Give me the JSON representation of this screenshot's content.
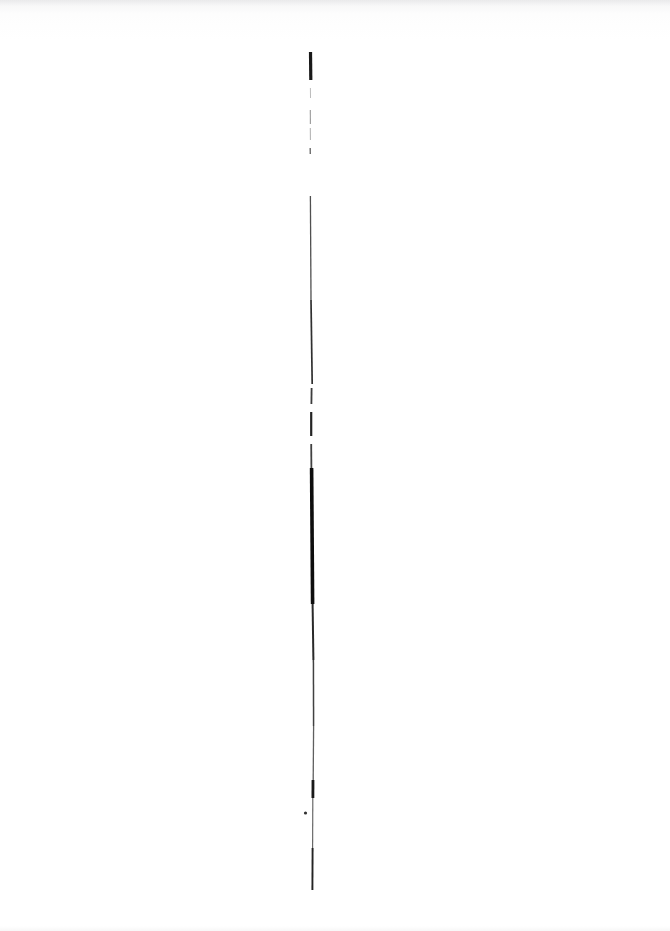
{
  "document": {
    "kind": "scanned-page",
    "page_width": 670,
    "page_height": 931,
    "background_color": "#ffffff",
    "ink_color": "#111111",
    "visible_text": "",
    "caption": ""
  },
  "artwork": {
    "name": "vertical-ink-stroke",
    "description": "A single near-vertical hand-drawn ink stroke running down the middle of an otherwise blank scanned page.",
    "stroke_color": "#0d0d0d",
    "start_y": 52,
    "end_y": 890,
    "center_x": 311,
    "segments": [
      {
        "name": "top-bold-tick",
        "y0": 52,
        "y1": 80,
        "x0": 310.5,
        "x1": 310.8,
        "width": 3.2,
        "opacity": 0.95
      },
      {
        "name": "faint-dash-a",
        "y0": 88,
        "y1": 98,
        "x0": 310.4,
        "x1": 310.5,
        "width": 1.0,
        "opacity": 0.28
      },
      {
        "name": "faint-dash-b",
        "y0": 110,
        "y1": 124,
        "x0": 310.3,
        "x1": 310.4,
        "width": 1.1,
        "opacity": 0.42
      },
      {
        "name": "faint-dash-c",
        "y0": 128,
        "y1": 140,
        "x0": 310.3,
        "x1": 310.4,
        "width": 1.0,
        "opacity": 0.33
      },
      {
        "name": "faint-dot-d",
        "y0": 148,
        "y1": 154,
        "x0": 310.2,
        "x1": 310.3,
        "width": 1.4,
        "opacity": 0.6
      },
      {
        "name": "upper-thin-run",
        "y0": 196,
        "y1": 300,
        "x0": 310.4,
        "x1": 311.0,
        "width": 1.3,
        "opacity": 0.72
      },
      {
        "name": "upper-mid-run",
        "y0": 300,
        "y1": 384,
        "x0": 311.0,
        "x1": 312.2,
        "width": 1.7,
        "opacity": 0.85
      },
      {
        "name": "break-gap-run",
        "y0": 388,
        "y1": 404,
        "x0": 311.6,
        "x1": 311.4,
        "width": 1.8,
        "opacity": 0.8
      },
      {
        "name": "short-blob-run",
        "y0": 412,
        "y1": 436,
        "x0": 311.2,
        "x1": 311.2,
        "width": 2.2,
        "opacity": 0.9
      },
      {
        "name": "pre-heavy-run",
        "y0": 444,
        "y1": 468,
        "x0": 311.2,
        "x1": 311.4,
        "width": 1.8,
        "opacity": 0.78
      },
      {
        "name": "heavy-core",
        "y0": 468,
        "y1": 604,
        "x0": 311.6,
        "x1": 312.6,
        "width": 3.6,
        "opacity": 1.0
      },
      {
        "name": "post-heavy-run",
        "y0": 604,
        "y1": 660,
        "x0": 312.6,
        "x1": 313.4,
        "width": 2.0,
        "opacity": 0.88
      },
      {
        "name": "lower-run-a",
        "y0": 660,
        "y1": 726,
        "x0": 313.4,
        "x1": 313.6,
        "width": 1.5,
        "opacity": 0.78
      },
      {
        "name": "lower-run-b",
        "y0": 726,
        "y1": 780,
        "x0": 313.6,
        "x1": 313.2,
        "width": 1.3,
        "opacity": 0.66
      },
      {
        "name": "lower-blob",
        "y0": 780,
        "y1": 798,
        "x0": 313.0,
        "x1": 312.9,
        "width": 2.8,
        "opacity": 0.95
      },
      {
        "name": "tail-run-a",
        "y0": 798,
        "y1": 848,
        "x0": 312.8,
        "x1": 312.6,
        "width": 1.2,
        "opacity": 0.62
      },
      {
        "name": "tail-run-b",
        "y0": 848,
        "y1": 890,
        "x0": 312.6,
        "x1": 312.4,
        "width": 1.9,
        "opacity": 0.9
      }
    ],
    "detached_marks": [
      {
        "name": "stray-dot",
        "cx": 305.5,
        "cy": 813,
        "r": 1.6,
        "opacity": 0.85
      }
    ]
  }
}
